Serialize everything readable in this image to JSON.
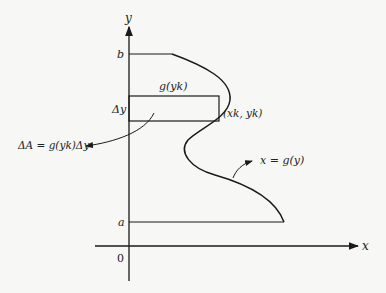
{
  "figure": {
    "axes": {
      "x_label": "x",
      "y_label": "y",
      "origin_label": "0"
    },
    "bounds": {
      "lower_label": "a",
      "upper_label": "b"
    },
    "strip": {
      "width_label": "g(yk)",
      "height_label": "Δy",
      "point_label": "(xk, yk)"
    },
    "curve": {
      "label": "x = g(y)"
    },
    "area_element": {
      "label": "ΔA = g(yk)Δy"
    },
    "colors": {
      "stroke": "#1a1a1a",
      "background": "#f7f7f5"
    }
  }
}
